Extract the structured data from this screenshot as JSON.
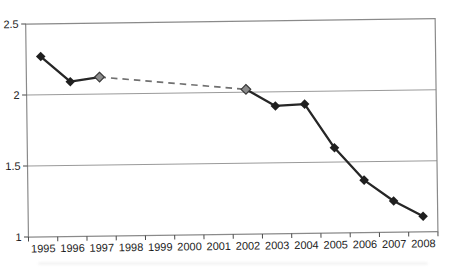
{
  "chart_data": {
    "type": "line",
    "title": "",
    "xlabel": "",
    "ylabel": "",
    "categories": [
      "1995",
      "1996",
      "1997",
      "1998",
      "1999",
      "2000",
      "2001",
      "2002",
      "2003",
      "2004",
      "2005",
      "2006",
      "2007",
      "2008"
    ],
    "series": [
      {
        "name": "series-1",
        "values": [
          2.27,
          2.09,
          2.12,
          null,
          null,
          null,
          null,
          2.02,
          1.9,
          1.91,
          1.6,
          1.37,
          1.22,
          1.11
        ],
        "marker": "diamond",
        "line_color": "#262626",
        "marker_color": "#1f1f1f"
      }
    ],
    "gap_connector": {
      "from": "1997",
      "to": "2002",
      "style": "dashed",
      "color": "#707070"
    },
    "gray_marker_years": [
      "1997",
      "2002"
    ],
    "gray_marker_fill": "#8c8c8c",
    "gray_marker_stroke": "#3a3a3a",
    "ylim": [
      1,
      2.5
    ],
    "yticks": [
      "1",
      "1.5",
      "2",
      "2.5"
    ],
    "grid": "horizontal",
    "legend": "none",
    "colors": {
      "axis_border": "#8a8a8a",
      "gridline": "#9a9a9a",
      "tick": "#4a4a4a",
      "tick_label": "#1c1c1c",
      "background": "#ffffff"
    }
  }
}
